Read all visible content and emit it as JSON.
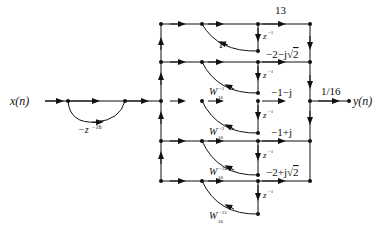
{
  "diagram": {
    "type": "signal-flow-graph",
    "input_label": "x(n)",
    "output_label": "y(n)",
    "comb": {
      "feedforward_gain": "-z",
      "feedforward_exponent": "-16"
    },
    "output_gain": "1/16",
    "branches": [
      {
        "coef": "13",
        "feedback": "1",
        "feedback_W_exp": "",
        "delay": "z",
        "delay_exp": "-1"
      },
      {
        "coef": "-2-j√2",
        "feedback": "W",
        "feedback_W_exp": "-1",
        "feedback_W_sub": "16",
        "delay": "z",
        "delay_exp": "-1"
      },
      {
        "coef": "-1-j",
        "feedback": "W",
        "feedback_W_exp": "-2",
        "feedback_W_sub": "16",
        "delay": "z",
        "delay_exp": "-1"
      },
      {
        "coef": "-1+j",
        "feedback": "W",
        "feedback_W_exp": "-14",
        "feedback_W_sub": "16",
        "delay": "z",
        "delay_exp": "-1"
      },
      {
        "coef": "-2+j√2",
        "feedback": "W",
        "feedback_W_exp": "-15",
        "feedback_W_sub": "16",
        "delay": "z",
        "delay_exp": "-1"
      }
    ]
  },
  "labels": {
    "x": "x(n)",
    "y": "y(n)",
    "comb_gain": "−z",
    "comb_exp": "−16",
    "out_gain": "1/16",
    "coef0": "13",
    "coef1_a": "−2−j",
    "coef1_b": "2",
    "coef2": "−1−j",
    "coef3": "−1+j",
    "coef4_a": "−2+j",
    "coef4_b": "2",
    "fb0": "1",
    "W": "W",
    "W_sub": "16",
    "W1_exp": "−1",
    "W2_exp": "−2",
    "W14_exp": "−14",
    "W15_exp": "−15",
    "z": "z",
    "z_exp": "−1"
  }
}
